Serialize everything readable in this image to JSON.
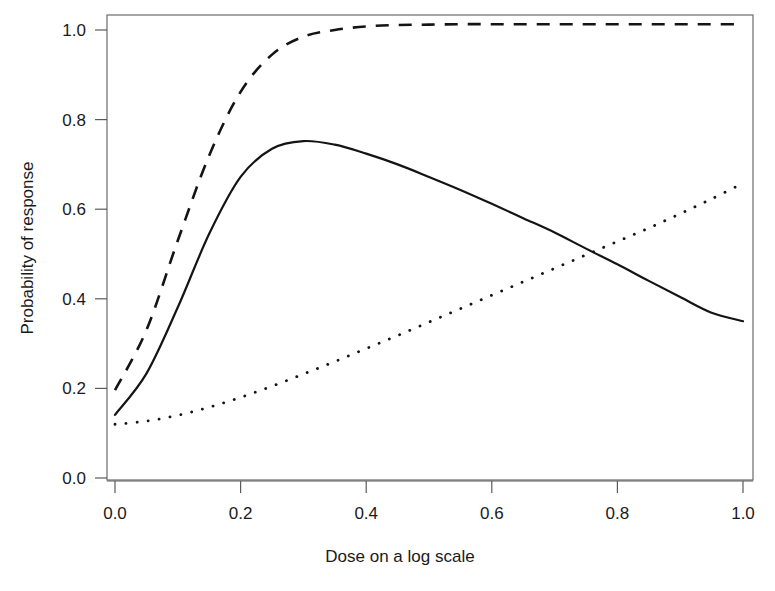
{
  "chart_data": {
    "type": "line",
    "title": "",
    "xlabel": "Dose on a log scale",
    "ylabel": "Probability of response",
    "xlim": [
      0.0,
      1.0
    ],
    "ylim": [
      0.0,
      1.02
    ],
    "grid": false,
    "legend": "none",
    "xticks": [
      "0.0",
      "0.2",
      "0.4",
      "0.6",
      "0.8",
      "1.0"
    ],
    "xtick_values": [
      0.0,
      0.2,
      0.4,
      0.6,
      0.8,
      1.0
    ],
    "yticks": [
      "0.0",
      "0.2",
      "0.4",
      "0.6",
      "0.8",
      "1.0"
    ],
    "ytick_values": [
      0.0,
      0.2,
      0.4,
      0.6,
      0.8,
      1.0
    ],
    "x": [
      0.0,
      0.05,
      0.1,
      0.15,
      0.2,
      0.25,
      0.3,
      0.35,
      0.4,
      0.45,
      0.5,
      0.55,
      0.6,
      0.65,
      0.7,
      0.75,
      0.8,
      0.85,
      0.9,
      0.95,
      1.0
    ],
    "series": [
      {
        "name": "solid-curve",
        "style": "solid",
        "color": "#141414",
        "values": [
          0.141,
          0.233,
          0.381,
          0.545,
          0.672,
          0.735,
          0.752,
          0.744,
          0.724,
          0.7,
          0.672,
          0.643,
          0.612,
          0.58,
          0.548,
          0.512,
          0.477,
          0.44,
          0.404,
          0.369,
          0.35
        ]
      },
      {
        "name": "dashed-curve",
        "style": "dashed",
        "color": "#141414",
        "values": [
          0.196,
          0.33,
          0.53,
          0.72,
          0.862,
          0.945,
          0.985,
          1.0,
          1.008,
          1.011,
          1.012,
          1.013,
          1.013,
          1.013,
          1.013,
          1.013,
          1.013,
          1.013,
          1.013,
          1.013,
          1.013
        ]
      },
      {
        "name": "dotted-curve",
        "style": "dotted",
        "color": "#141414",
        "values": [
          0.12,
          0.127,
          0.14,
          0.158,
          0.18,
          0.205,
          0.232,
          0.26,
          0.289,
          0.318,
          0.348,
          0.378,
          0.408,
          0.438,
          0.468,
          0.498,
          0.528,
          0.558,
          0.59,
          0.623,
          0.658
        ]
      }
    ]
  },
  "axes": {
    "x_title": "Dose on a log scale",
    "y_title": "Probability of response"
  }
}
